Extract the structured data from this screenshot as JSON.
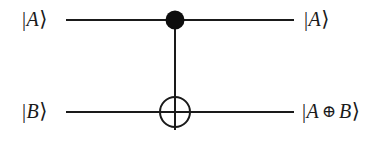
{
  "figure": {
    "kind": "quantum-circuit-diagram",
    "name": "CNOT gate",
    "background_color": "#ffffff",
    "ink_color": "#1a1a1a",
    "width": 387,
    "height": 142
  },
  "inputs": {
    "top": {
      "bar": "|",
      "symbol": "A",
      "angle": "⟩"
    },
    "bottom": {
      "bar": "|",
      "symbol": "B",
      "angle": "⟩"
    }
  },
  "outputs": {
    "top": {
      "bar": "|",
      "symbol": "A",
      "angle": "⟩"
    },
    "bottom": {
      "bar": "|",
      "symbol_left": "A",
      "operator": "⊕",
      "symbol_right": "B",
      "angle": "⟩"
    }
  },
  "geometry": {
    "wire_top_y": 20,
    "wire_bottom_y": 112,
    "wire_left_x": 66,
    "wire_right_x": 294,
    "gate_x": 175,
    "control_dot_radius": 9.5,
    "target_circle_radius": 15,
    "stroke_width": 2
  },
  "elements": {
    "wire_top_name": "qubit-wire-top",
    "wire_bottom_name": "qubit-wire-bottom",
    "control_name": "control-dot",
    "target_name": "target-xor-circle",
    "link_name": "control-target-link"
  }
}
